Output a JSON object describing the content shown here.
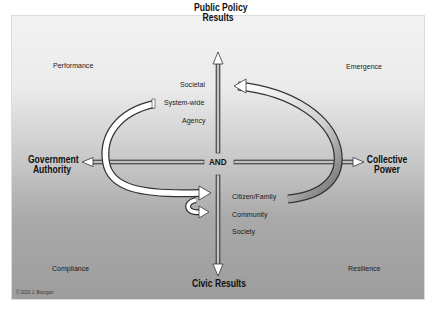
{
  "diagram": {
    "axes": {
      "top": {
        "line1": "Public Policy",
        "line2": "Results"
      },
      "bottom": {
        "label": "Civic Results"
      },
      "left": {
        "line1": "Government",
        "line2": "Authority"
      },
      "right": {
        "line1": "Collective",
        "line2": "Power"
      },
      "center": "AND"
    },
    "quadrants": {
      "top_left": "Performance",
      "top_right": "Emergence",
      "bottom_left": "Compliance",
      "bottom_right": "Resilience"
    },
    "upper_levels": [
      "Societal",
      "System-wide",
      "Agency"
    ],
    "lower_levels": [
      "Citizen/Family",
      "Community",
      "Society"
    ],
    "copyright": "© 2010 J. Bourgon",
    "colors": {
      "background_top": "#f2f2f2",
      "background_bottom": "#9d9d9d",
      "text": "#1a1a1a",
      "arrow_fill": "#ffffff",
      "arrow_outline": "#333333"
    }
  }
}
